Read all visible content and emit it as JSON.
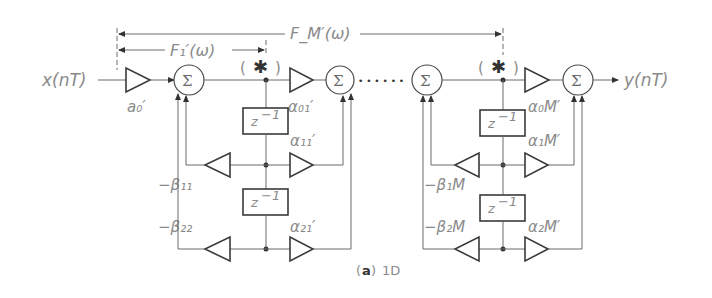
{
  "diagram": {
    "caption_letter": "a",
    "caption_text": "1D",
    "input_label": "x(nT)",
    "output_label": "y(nT)",
    "sum_symbol": "Σ",
    "delay_label": "z",
    "delay_exp": "−1",
    "tap_marker": "✱",
    "span_first": "F₁′(ω)",
    "span_all": "F_M′(ω)",
    "ellipsis": "• • • • • •",
    "input_gain": "a₀′",
    "sections": [
      {
        "alpha0": "α₀₁′",
        "alpha1": "α₁₁′",
        "alpha2": "α₂₁′",
        "beta1": "−β₁₁",
        "beta2": "−β₂₂"
      },
      {
        "alpha0": "α₀M′",
        "alpha1": "α₁M′",
        "alpha2": "α₂M′",
        "beta1": "−β₁M",
        "beta2": "−β₂M"
      }
    ]
  }
}
